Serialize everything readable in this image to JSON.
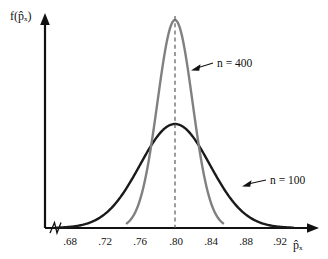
{
  "figure": {
    "background_color": "#ffffff",
    "axis_color": "#111111"
  },
  "axes": {
    "y_axis_title": "f(p̂ₓ)",
    "x_axis_title": "p̂ₓ",
    "y_axis_name": "density-axis",
    "x_axis_name": "sample-proportion-axis",
    "axis_break_present": "yes"
  },
  "chart_data": {
    "type": "line",
    "title": "",
    "subtitle": "",
    "xlabel": "p̂ₓ",
    "ylabel": "f(p̂ₓ)",
    "xlim": [
      0.66,
      0.94
    ],
    "ylim": [
      0,
      1.05
    ],
    "grid": false,
    "legend_position": "inline-annotation",
    "x_ticks": [
      0.68,
      0.72,
      0.76,
      0.8,
      0.84,
      0.88,
      0.92
    ],
    "x_tick_labels": [
      ".68",
      ".72",
      ".76",
      ".80",
      ".84",
      ".88",
      ".92"
    ],
    "y_ticks": [],
    "y_tick_labels": [],
    "center": 0.8,
    "center_line": {
      "x": 0.8,
      "style": "dashed",
      "color": "#5a5a5a",
      "label": ""
    },
    "series": [
      {
        "name": "n = 400",
        "color": "#808080",
        "type": "normal-density",
        "mean": 0.8,
        "sigma": 0.02,
        "peak_height": 1.0,
        "visible_range": [
          0.745,
          0.855
        ],
        "x": [
          0.745,
          0.75,
          0.755,
          0.76,
          0.765,
          0.77,
          0.775,
          0.78,
          0.785,
          0.79,
          0.795,
          0.8,
          0.805,
          0.81,
          0.815,
          0.82,
          0.825,
          0.83,
          0.835,
          0.84,
          0.845,
          0.85,
          0.855
        ],
        "y": [
          0.003,
          0.006,
          0.011,
          0.022,
          0.04,
          0.07,
          0.117,
          0.183,
          0.27,
          0.375,
          0.487,
          0.592,
          0.676,
          0.727,
          0.74,
          0.716,
          0.663,
          0.593,
          0.516,
          0.442,
          0.375,
          0.317,
          0.268
        ]
      },
      {
        "name": "n = 100",
        "color": "#1a1a1a",
        "type": "normal-density",
        "mean": 0.8,
        "sigma": 0.04,
        "peak_height": 0.5,
        "visible_range": [
          0.665,
          0.935
        ],
        "x": [
          0.665,
          0.675,
          0.685,
          0.695,
          0.705,
          0.715,
          0.725,
          0.735,
          0.745,
          0.755,
          0.765,
          0.775,
          0.785,
          0.795,
          0.8,
          0.805,
          0.815,
          0.825,
          0.835,
          0.845,
          0.855,
          0.865,
          0.875,
          0.885,
          0.895,
          0.905,
          0.915,
          0.925,
          0.935
        ],
        "y": [
          0.008,
          0.016,
          0.029,
          0.049,
          0.079,
          0.121,
          0.176,
          0.243,
          0.317,
          0.391,
          0.454,
          0.495,
          0.51,
          0.497,
          0.485,
          0.468,
          0.425,
          0.366,
          0.3,
          0.235,
          0.176,
          0.126,
          0.086,
          0.056,
          0.035,
          0.02,
          0.011,
          0.006,
          0.003
        ]
      }
    ],
    "annotations": [
      {
        "text": "n = 400",
        "target_series": "n = 400",
        "leader": true,
        "label_x": 0.834,
        "label_y": 0.86
      },
      {
        "text": "n = 100",
        "target_series": "n = 100",
        "leader": true,
        "label_x": 0.896,
        "label_y": 0.235
      }
    ]
  }
}
